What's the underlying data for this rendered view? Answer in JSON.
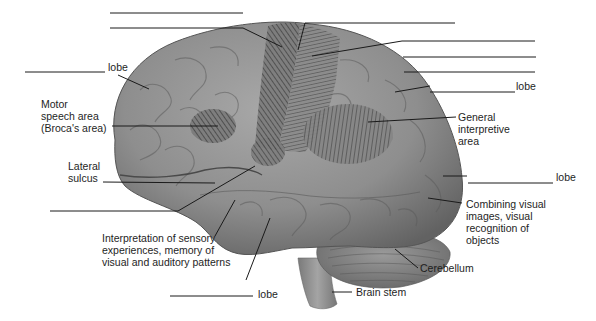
{
  "diagram": {
    "type": "labeled anatomical illustration",
    "labels": {
      "frontal_lobe": "lobe",
      "motor_speech": [
        "Motor",
        "speech area",
        "(Broca's area)"
      ],
      "lateral_sulcus": [
        "Lateral",
        "sulcus"
      ],
      "temporal_function": [
        "Interpretation of sensory",
        "experiences, memory of",
        "visual and auditory patterns"
      ],
      "temporal_lobe": "lobe",
      "parietal_lobe": "lobe",
      "general_interpretive": [
        "General",
        "interpretive",
        "area"
      ],
      "occipital_lobe": "lobe",
      "occipital_function": [
        "Combining visual",
        "images, visual",
        "recognition of",
        "objects"
      ],
      "cerebellum": "Cerebellum",
      "brain_stem": "Brain stem"
    },
    "blank_answer_lines": 10,
    "colors": {
      "brain_fill": "#8c8c8c",
      "brain_dark": "#5e5e5e",
      "brain_light": "#b5b5b5",
      "hatch": "#3a3a3a",
      "leader_line": "#1a1a1a",
      "background": "#ffffff"
    }
  }
}
